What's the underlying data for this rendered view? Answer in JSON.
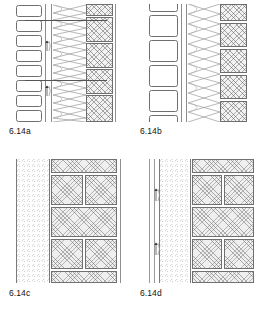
{
  "figure": {
    "sheet_label": "Wall assembly details 6.14",
    "panels": [
      {
        "id": "a",
        "caption_num": "6.14",
        "caption_suffix": "a",
        "caption": "6.14a",
        "description": "Cavity wall with narrow insulation batts, bow-tie tie mesh and cross-hatched masonry leaf",
        "layers": [
          {
            "name": "insulation-batts",
            "kind": "batt-column",
            "count": 8
          },
          {
            "name": "air-cavity-strip",
            "kind": "strip"
          },
          {
            "name": "tie-mesh",
            "kind": "bowtie-mesh",
            "rows": 8
          },
          {
            "name": "masonry-leaf",
            "kind": "cross-hatch-blocks",
            "count": 5
          },
          {
            "name": "outer-rule",
            "kind": "rule"
          }
        ],
        "tie_markers": 2,
        "leader_lines": 2
      },
      {
        "id": "b",
        "caption_num": "6.14",
        "caption_suffix": "b",
        "caption": "6.14b",
        "description": "Cavity wall with large square insulation blocks, bow-tie tie mesh and cross-hatched masonry leaf",
        "layers": [
          {
            "name": "insulation-blocks",
            "kind": "batt-column",
            "count": 6
          },
          {
            "name": "air-cavity-strip",
            "kind": "strip"
          },
          {
            "name": "tie-mesh",
            "kind": "bowtie-mesh",
            "rows": 6
          },
          {
            "name": "masonry-leaf",
            "kind": "cross-hatch-blocks",
            "count": 5
          },
          {
            "name": "outer-rule",
            "kind": "rule"
          }
        ],
        "tie_markers": 0,
        "leader_lines": 0
      },
      {
        "id": "c",
        "caption_num": "6.14",
        "caption_suffix": "c",
        "caption": "6.14c",
        "description": "Solid wall with stippled granular insulation layer against running-bond masonry",
        "layers": [
          {
            "name": "granular-insulation",
            "kind": "stipple"
          },
          {
            "name": "masonry-leaf",
            "kind": "running-bond",
            "courses": 5
          },
          {
            "name": "outer-rule",
            "kind": "rule"
          }
        ],
        "tie_markers": 0,
        "leader_lines": 0
      },
      {
        "id": "d",
        "caption_num": "6.14",
        "caption_suffix": "d",
        "caption": "6.14d",
        "description": "Solid wall with outer lining strip, stippled granular insulation and running-bond masonry with wall ties",
        "layers": [
          {
            "name": "outer-lining-strip",
            "kind": "strip-wide"
          },
          {
            "name": "granular-insulation",
            "kind": "stipple"
          },
          {
            "name": "masonry-leaf",
            "kind": "running-bond",
            "courses": 5
          },
          {
            "name": "outer-rule",
            "kind": "rule"
          }
        ],
        "tie_markers": 2,
        "leader_lines": 0
      }
    ]
  },
  "colors": {
    "ink": "#1a1a1a",
    "line": "#707070",
    "hatch": "#5f5f5f",
    "fill": "#efefef",
    "page": "#ffffff"
  }
}
